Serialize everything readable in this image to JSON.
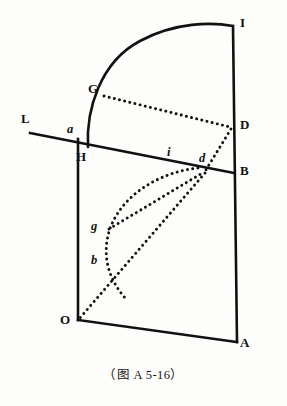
{
  "figure": {
    "caption": "（图 A 5-16）",
    "stroke_color": "#111111",
    "background_color": "#fdfdfb",
    "width": 287,
    "height": 406,
    "labels": {
      "I": "I",
      "G": "G",
      "L": "L",
      "D": "D",
      "B": "B",
      "A": "A",
      "O": "O",
      "H": "H",
      "a": "a",
      "i": "i",
      "d": "d",
      "g": "g",
      "b": "b"
    },
    "points": {
      "I": {
        "x": 233,
        "y": 26,
        "label_x": 240,
        "label_y": 16,
        "case": "upper"
      },
      "G": {
        "x": 104,
        "y": 96,
        "label_x": 88,
        "label_y": 82,
        "case": "upper"
      },
      "L": {
        "x": 30,
        "y": 133,
        "label_x": 21,
        "label_y": 112,
        "case": "upper"
      },
      "D": {
        "x": 232,
        "y": 127,
        "label_x": 240,
        "label_y": 118,
        "case": "upper"
      },
      "B": {
        "x": 233,
        "y": 173,
        "label_x": 240,
        "label_y": 164,
        "case": "upper"
      },
      "A": {
        "x": 237,
        "y": 342,
        "label_x": 240,
        "label_y": 344,
        "case": "upper"
      },
      "O": {
        "x": 78,
        "y": 320,
        "label_x": 60,
        "label_y": 313,
        "case": "upper"
      },
      "H": {
        "x": 82,
        "y": 147,
        "label_x": 76,
        "label_y": 150,
        "case": "upper"
      },
      "a": {
        "x": 78,
        "y": 139,
        "label_x": 67,
        "label_y": 123,
        "case": "lower"
      },
      "i": {
        "x": 171,
        "y": 160,
        "label_x": 166,
        "label_y": 146,
        "case": "lower"
      },
      "d": {
        "x": 205,
        "y": 172,
        "label_x": 199,
        "label_y": 153,
        "case": "lower"
      },
      "g": {
        "x": 108,
        "y": 229,
        "label_x": 92,
        "label_y": 219,
        "case": "lower"
      },
      "b": {
        "x": 108,
        "y": 263,
        "label_x": 92,
        "label_y": 253,
        "case": "lower"
      }
    },
    "segments": [
      {
        "name": "left-vertical-a-O",
        "style": "solid",
        "from": "a",
        "to": "O"
      },
      {
        "name": "bottom-edge-O-A",
        "style": "solid",
        "from": "O",
        "to": "A"
      },
      {
        "name": "right-vertical-I-A",
        "style": "solid",
        "from": "I",
        "to": "A"
      },
      {
        "name": "transversal-L-B",
        "style": "solid",
        "from": "L",
        "to": "B"
      },
      {
        "name": "chord-G-D",
        "style": "dotted",
        "from": "G",
        "to": "D"
      },
      {
        "name": "segment-D-d",
        "style": "dotted",
        "from": "D",
        "to": "d"
      },
      {
        "name": "segment-d-O",
        "style": "dotted",
        "from": "d",
        "to": "O"
      },
      {
        "name": "segment-g-d",
        "style": "dotted",
        "from": "g",
        "to": "d"
      }
    ],
    "arcs": [
      {
        "name": "major-arc-H-G-I",
        "style": "solid",
        "description": "quarter arc from baseline near H through G up to I",
        "path": "M 88 147 C 86 110 100 62 140 41 C 175 22 212 22 233 26"
      },
      {
        "name": "minor-arc-i-g-b",
        "style": "dotted",
        "description": "dotted curve from point i through g and b down to segment d-O",
        "path": "M 176 166 C 150 176 120 196 110 226 C 102 252 106 276 124 298"
      }
    ]
  }
}
